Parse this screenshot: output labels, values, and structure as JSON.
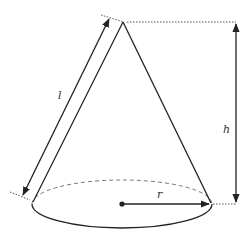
{
  "diagram": {
    "type": "cone",
    "labels": {
      "slant": "l",
      "height": "h",
      "radius": "r"
    },
    "colors": {
      "stroke": "#222222",
      "dashed": "#777777",
      "background": "#ffffff"
    }
  }
}
